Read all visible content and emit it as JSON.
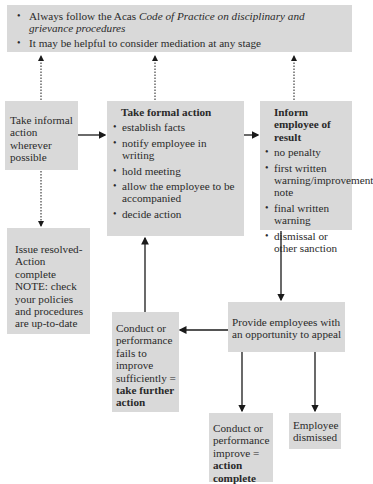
{
  "banner": {
    "items": [
      {
        "prefix": "Always follow the Acas ",
        "italic": "Code of Practice on disciplinary and grievance procedures"
      },
      {
        "text": "It may be helpful to consider mediation at any stage"
      }
    ]
  },
  "informal": {
    "text": "Take informal action wherever possible"
  },
  "formal": {
    "title": "Take formal action",
    "items": [
      "establish facts",
      "notify employee in writing",
      "hold meeting",
      "allow the employee to be accompanied",
      "decide action"
    ]
  },
  "inform": {
    "title": "Inform employee of result",
    "items": [
      "no penalty",
      "first written warning/improvement note",
      "final written warning",
      "dismissal or other sanction"
    ]
  },
  "resolved": {
    "line1": "Issue resolved-",
    "line2": "Action complete",
    "note": "NOTE: check your policies and procedures are up-to-date"
  },
  "fails": {
    "text": "Conduct or performance fails to improve sufficiently =",
    "bold": "take further action"
  },
  "appeal": {
    "text": "Provide employees with an opportunity to appeal"
  },
  "improves": {
    "text": "Conduct or performance improve =",
    "bold": "action complete"
  },
  "dismissed": {
    "text": "Employee dismissed"
  },
  "colors": {
    "box_fill": "#d9d9d9",
    "line": "#1a1a1a",
    "background": "#ffffff"
  }
}
